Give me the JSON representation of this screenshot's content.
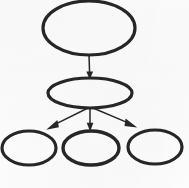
{
  "canvas": {
    "width": 189,
    "height": 188,
    "background_color": "#fdfdfd",
    "stroke_color": "#262626",
    "node_stroke_width": 3,
    "edge_stroke_width": 1.4
  },
  "diagram": {
    "type": "tree-hierarchy",
    "title": "",
    "node_shape": "ellipse",
    "node_fill": "none",
    "orientation": "top-down",
    "levels": 3,
    "node_count": 5,
    "edge_count": 4,
    "nodes": [
      {
        "id": "root",
        "label": "",
        "level": 0,
        "cx": 89,
        "cy": 28,
        "rx": 46,
        "ry": 27
      },
      {
        "id": "intermediate",
        "label": "",
        "level": 1,
        "cx": 90,
        "cy": 93,
        "rx": 42,
        "ry": 15
      },
      {
        "id": "leaf-left",
        "label": "",
        "level": 2,
        "cx": 29,
        "cy": 148,
        "rx": 27,
        "ry": 17
      },
      {
        "id": "leaf-center",
        "label": "",
        "level": 2,
        "cx": 91,
        "cy": 148,
        "rx": 28,
        "ry": 17
      },
      {
        "id": "leaf-right",
        "label": "",
        "level": 2,
        "cx": 155,
        "cy": 147,
        "rx": 27,
        "ry": 17
      }
    ],
    "edges": [
      {
        "id": "edge-root-intermediate",
        "from": "root",
        "to": "intermediate",
        "label": "",
        "arrow": "triangle-filled",
        "x1": 89,
        "y1": 55,
        "x2": 90,
        "y2": 79
      },
      {
        "id": "edge-intermediate-leaf-left",
        "from": "intermediate",
        "to": "leaf-left",
        "label": "",
        "arrow": "triangle-filled",
        "x1": 88,
        "y1": 108,
        "x2": 46,
        "y2": 130
      },
      {
        "id": "edge-intermediate-leaf-center",
        "from": "intermediate",
        "to": "leaf-center",
        "label": "",
        "arrow": "triangle-filled",
        "x1": 90,
        "y1": 108,
        "x2": 90,
        "y2": 131
      },
      {
        "id": "edge-intermediate-leaf-right",
        "from": "intermediate",
        "to": "leaf-right",
        "label": "",
        "arrow": "triangle-filled",
        "x1": 93,
        "y1": 108,
        "x2": 137,
        "y2": 128
      }
    ]
  }
}
